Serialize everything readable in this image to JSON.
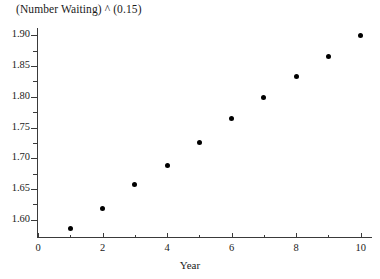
{
  "figure": {
    "clipped_top_text": "",
    "title": "(Number Waiting) ^ (0.15)",
    "xaxis_title": "Year"
  },
  "chart_data": {
    "type": "scatter",
    "title": "(Number Waiting) ^ (0.15)",
    "xlabel": "Year",
    "ylabel": "",
    "x": [
      1,
      2,
      3,
      4,
      5,
      6,
      7,
      8,
      9,
      10
    ],
    "values": [
      1.585,
      1.618,
      1.658,
      1.689,
      1.725,
      1.765,
      1.799,
      1.833,
      1.866,
      1.9
    ],
    "series": [
      {
        "name": "(Number Waiting) ^ (0.15)",
        "points": [
          {
            "x": 1,
            "y": 1.585
          },
          {
            "x": 2,
            "y": 1.618
          },
          {
            "x": 3,
            "y": 1.658
          },
          {
            "x": 4,
            "y": 1.689
          },
          {
            "x": 5,
            "y": 1.725
          },
          {
            "x": 6,
            "y": 1.765
          },
          {
            "x": 7,
            "y": 1.799
          },
          {
            "x": 8,
            "y": 1.833
          },
          {
            "x": 9,
            "y": 1.866
          },
          {
            "x": 10,
            "y": 1.9
          }
        ]
      }
    ],
    "xlim": [
      0,
      10.35
    ],
    "ylim": [
      1.5735,
      1.9085
    ],
    "xticks": [
      0,
      2,
      4,
      6,
      8,
      10
    ],
    "xticklabels": [
      "0",
      "2",
      "4",
      "6",
      "8",
      "10"
    ],
    "xminorticks": [
      1,
      3,
      5,
      7,
      9
    ],
    "yticks": [
      1.6,
      1.65,
      1.7,
      1.75,
      1.8,
      1.85,
      1.9
    ],
    "yticklabels": [
      "1.60",
      "1.65",
      "1.70",
      "1.75",
      "1.80",
      "1.85",
      "1.90"
    ],
    "yminorticks": [
      1.625,
      1.675,
      1.725,
      1.775,
      1.825,
      1.875
    ],
    "grid": false,
    "legend": false,
    "marker": "filled-circle",
    "marker_color": "#000000",
    "axis_color": "#3a3a3a"
  }
}
